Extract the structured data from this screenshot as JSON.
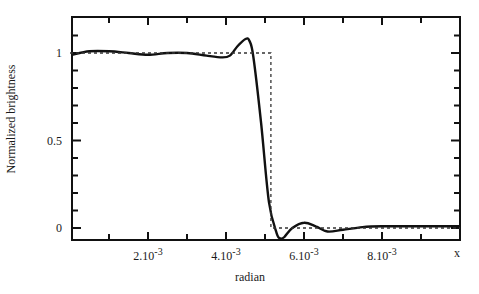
{
  "chart_data": {
    "type": "line",
    "title": "",
    "xlabel": "radian",
    "ylabel": "Normalized brightness",
    "x_axis_end_label": "x",
    "xlim": [
      0,
      0.01
    ],
    "ylim": [
      -0.07,
      1.2
    ],
    "grid": false,
    "legend": "none",
    "x_ticks": [
      {
        "value": 0.002,
        "label": "2.10",
        "exp": "-3"
      },
      {
        "value": 0.004,
        "label": "4.10",
        "exp": "-3"
      },
      {
        "value": 0.006,
        "label": "6.10",
        "exp": "-3"
      },
      {
        "value": 0.008,
        "label": "8.10",
        "exp": "-3"
      }
    ],
    "y_ticks": [
      {
        "value": 0,
        "label": "0"
      },
      {
        "value": 0.5,
        "label": "0.5"
      },
      {
        "value": 1,
        "label": "1"
      }
    ],
    "series": [
      {
        "name": "reconstructed profile",
        "style": "solid",
        "color": "#111111",
        "x": [
          5e-05,
          0.0005,
          0.001,
          0.0015,
          0.002,
          0.0025,
          0.003,
          0.0035,
          0.0039,
          0.0041,
          0.0043,
          0.0045,
          0.0046,
          0.0047,
          0.0049,
          0.0051,
          0.0053,
          0.0054,
          0.0055,
          0.0057,
          0.006,
          0.0063,
          0.0066,
          0.007,
          0.0075,
          0.008,
          0.009,
          0.01
        ],
        "y": [
          0.99,
          1.01,
          1.01,
          1.0,
          0.99,
          1.0,
          1.0,
          0.985,
          0.975,
          0.985,
          1.04,
          1.08,
          1.07,
          0.98,
          0.6,
          0.15,
          -0.03,
          -0.06,
          -0.05,
          0.0,
          0.03,
          0.01,
          -0.02,
          -0.01,
          0.005,
          0.01,
          0.01,
          0.01
        ]
      },
      {
        "name": "ideal step",
        "style": "dashed",
        "color": "#333333",
        "x": [
          0.0,
          0.00515,
          0.00515,
          0.01
        ],
        "y": [
          1.0,
          1.0,
          0.0,
          0.0
        ]
      }
    ]
  }
}
